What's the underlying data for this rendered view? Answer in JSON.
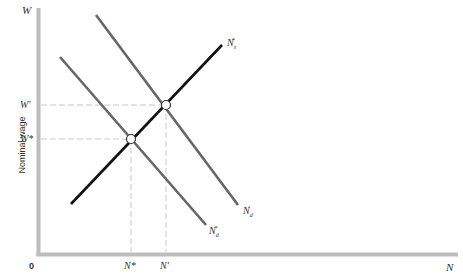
{
  "diagram": {
    "type": "labor market diagram",
    "y_axis": {
      "symbol": "W",
      "label": "Nominal wage"
    },
    "x_axis": {
      "symbol": "N",
      "origin": "0"
    },
    "y_ticks": [
      {
        "label": "W′",
        "y": 105
      },
      {
        "label": "W*",
        "y": 139
      }
    ],
    "x_ticks": [
      {
        "label": "N*",
        "x": 131
      },
      {
        "label": "N′",
        "x": 166
      }
    ],
    "curves": [
      {
        "name": "N_s*",
        "label_base": "N",
        "label_sub": "s",
        "label_sup": "*",
        "color": "#111111",
        "from": [
          71,
          204
        ],
        "to": [
          222,
          45
        ]
      },
      {
        "name": "N_d*",
        "label_base": "N",
        "label_sub": "d",
        "label_sup": "*",
        "color": "#666666",
        "from": [
          60,
          57
        ],
        "to": [
          206,
          225
        ]
      },
      {
        "name": "N_d′",
        "label_base": "N",
        "label_sub": "d",
        "label_sup": "′",
        "color": "#666666",
        "from": [
          96,
          15
        ],
        "to": [
          238,
          205
        ]
      }
    ],
    "equilibria": [
      {
        "name": "initial",
        "x": 131,
        "y": 139
      },
      {
        "name": "new",
        "x": 166,
        "y": 105
      }
    ],
    "colors": {
      "axis": "#bdbdbd",
      "guide": "#c8c8c8",
      "supply": "#111111",
      "demand": "#666666"
    }
  }
}
